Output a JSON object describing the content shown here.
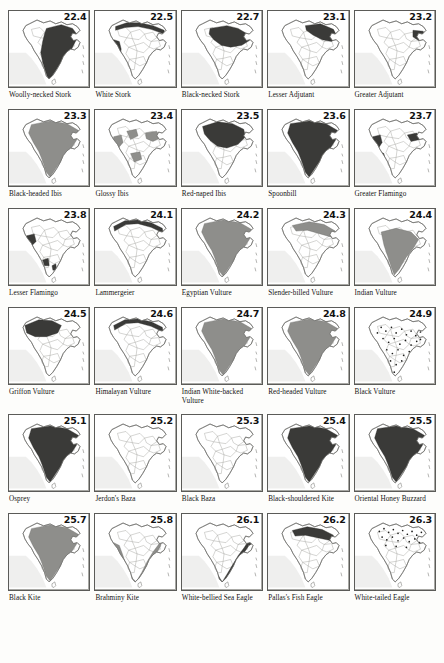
{
  "plate": {
    "title": "Distribution maps of Indian birds",
    "columns": 5,
    "rows": 6,
    "map_region": "India",
    "colors": {
      "range_dark": "#3a3a38",
      "range_mid": "#8e8e8b",
      "outline": "#6d6d6a",
      "state_border": "#9a9a96",
      "sea": "#efefee",
      "background": "#fdfdfb",
      "text": "#121212"
    }
  },
  "panels": [
    {
      "number": "22.4",
      "name": "Woolly-necked Stork",
      "range": "widespread-peninsular",
      "shading": "dark"
    },
    {
      "number": "22.5",
      "name": "White Stork",
      "range": "himalayan-band-west-coast",
      "shading": "dark"
    },
    {
      "number": "22.7",
      "name": "Black-necked Stork",
      "range": "north-east-central",
      "shading": "dark"
    },
    {
      "number": "23.1",
      "name": "Lesser Adjutant",
      "range": "north-east-terai",
      "shading": "dark"
    },
    {
      "number": "23.2",
      "name": "Greater Adjutant",
      "range": "north-east-small",
      "shading": "dark"
    },
    {
      "number": "23.3",
      "name": "Black-headed Ibis",
      "range": "widespread-mid",
      "shading": "mid"
    },
    {
      "number": "23.4",
      "name": "Glossy Ibis",
      "range": "scattered-west-east",
      "shading": "mid"
    },
    {
      "number": "23.5",
      "name": "Red-naped Ibis",
      "range": "northern-central-dark",
      "shading": "dark"
    },
    {
      "number": "23.6",
      "name": "Spoonbill",
      "range": "widespread-dark",
      "shading": "dark"
    },
    {
      "number": "23.7",
      "name": "Greater Flamingo",
      "range": "west-coast-patches",
      "shading": "dark"
    },
    {
      "number": "23.8",
      "name": "Lesser Flamingo",
      "range": "west-gujarat-patches",
      "shading": "dark"
    },
    {
      "number": "24.1",
      "name": "Lammergeier",
      "range": "himalaya-band",
      "shading": "dark"
    },
    {
      "number": "24.2",
      "name": "Egyptian Vulture",
      "range": "widespread-mid",
      "shading": "mid"
    },
    {
      "number": "24.3",
      "name": "Slender-billed Vulture",
      "range": "north-east-band",
      "shading": "mid"
    },
    {
      "number": "24.4",
      "name": "Indian Vulture",
      "range": "peninsular-mid",
      "shading": "mid"
    },
    {
      "number": "24.5",
      "name": "Griffon Vulture",
      "range": "north-west-dark",
      "shading": "dark"
    },
    {
      "number": "24.6",
      "name": "Himalayan Vulture",
      "range": "himalaya-band",
      "shading": "dark"
    },
    {
      "number": "24.7",
      "name": "Indian White-backed Vulture",
      "range": "widespread-mid",
      "shading": "mid"
    },
    {
      "number": "24.8",
      "name": "Red-headed Vulture",
      "range": "widespread-mid",
      "shading": "mid"
    },
    {
      "number": "24.9",
      "name": "Black Vulture",
      "range": "scattered-dots",
      "shading": "dots"
    },
    {
      "number": "25.1",
      "name": "Osprey",
      "range": "widespread-dark",
      "shading": "dark"
    },
    {
      "number": "25.2",
      "name": "Jerdon's Baza",
      "range": "north-east-west-coast",
      "shading": "dark"
    },
    {
      "number": "25.3",
      "name": "Black Baza",
      "range": "north-east-west-coast",
      "shading": "dark"
    },
    {
      "number": "25.4",
      "name": "Black-shouldered Kite",
      "range": "widespread-dark",
      "shading": "dark"
    },
    {
      "number": "25.5",
      "name": "Oriental Honey Buzzard",
      "range": "widespread-dark",
      "shading": "dark"
    },
    {
      "number": "25.7",
      "name": "Black Kite",
      "range": "widespread-mid",
      "shading": "mid"
    },
    {
      "number": "25.8",
      "name": "Brahminy Kite",
      "range": "coastal-peninsular",
      "shading": "mid"
    },
    {
      "number": "26.1",
      "name": "White-bellied Sea Eagle",
      "range": "coastal-outline",
      "shading": "dark"
    },
    {
      "number": "26.2",
      "name": "Pallas's Fish Eagle",
      "range": "north-plains",
      "shading": "dark"
    },
    {
      "number": "26.3",
      "name": "White-tailed Eagle",
      "range": "north-dots",
      "shading": "dots"
    }
  ]
}
